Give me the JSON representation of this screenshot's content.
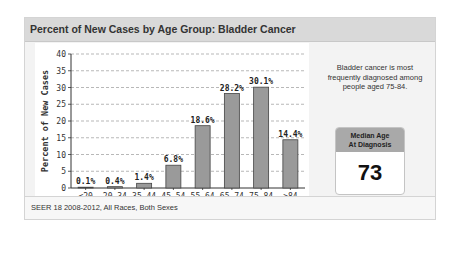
{
  "panel": {
    "title": "Percent of New Cases by Age Group: Bladder Cancer"
  },
  "side": {
    "description": "Bladder cancer is most frequently diagnosed among people aged 75-84.",
    "median_label_line1": "Median Age",
    "median_label_line2": "At Diagnosis",
    "median_value": "73"
  },
  "footer": {
    "source": "SEER 18 2008-2012, All Races, Both Sexes"
  },
  "colors": {
    "bar_fill": "#9a9a9a",
    "bar_stroke": "#444444",
    "header_bg": "#d9d9d9",
    "median_head_bg": "#a9a9a9"
  },
  "chart_data": {
    "type": "bar",
    "title": "Percent of New Cases by Age Group: Bladder Cancer",
    "xlabel": "Age",
    "ylabel": "Percent of New Cases",
    "categories": [
      "<20",
      "20-34",
      "35-44",
      "45-54",
      "55-64",
      "65-74",
      "75-84",
      ">84"
    ],
    "values": [
      0.1,
      0.4,
      1.4,
      6.8,
      18.6,
      28.2,
      30.1,
      14.4
    ],
    "value_labels": [
      "0.1%",
      "0.4%",
      "1.4%",
      "6.8%",
      "18.6%",
      "28.2%",
      "30.1%",
      "14.4%"
    ],
    "ylim": [
      0,
      40
    ],
    "yticks": [
      0,
      5,
      10,
      15,
      20,
      25,
      30,
      35,
      40
    ],
    "grid": "horizontal dashed",
    "legend": "none"
  }
}
